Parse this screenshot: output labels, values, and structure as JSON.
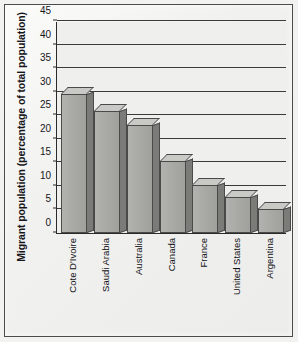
{
  "chart_data": {
    "type": "bar",
    "title": "",
    "xlabel": "",
    "ylabel": "Migrant population (percentage of total population)",
    "categories": [
      "Cote D'Ivoire",
      "Saudi Arabia",
      "Australia",
      "Canada",
      "France",
      "United States",
      "Argentina"
    ],
    "values": [
      29.5,
      25.8,
      23.0,
      15.2,
      10.2,
      7.7,
      5.0
    ],
    "ylim": [
      0,
      45
    ],
    "yticks": [
      0,
      5,
      10,
      15,
      20,
      25,
      30,
      35,
      40,
      45
    ],
    "ytick_labels": [
      "0",
      "5",
      "10",
      "15",
      "20",
      "25",
      "30",
      "35",
      "40",
      "45"
    ],
    "grid": true,
    "grid_axis": "y",
    "legend": "none",
    "bar_style": "3d-shaded-gray",
    "colors": {
      "bar_front": "#a9a9a5",
      "bar_side": "#7b7b78",
      "bar_top": "#c9c9c5",
      "bar_outline": "#4a4a48",
      "axis": "#2b2b2b",
      "gridline": "#3a3a3a",
      "plot_background": "#efefed",
      "figure_background": "#f2f2f0",
      "text": "#16161a"
    }
  }
}
